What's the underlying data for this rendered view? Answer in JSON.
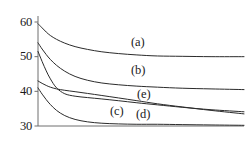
{
  "chart_data": {
    "type": "line",
    "title": "",
    "xlabel": "",
    "ylabel": "",
    "xlim": [
      0,
      100
    ],
    "ylim": [
      30,
      60
    ],
    "grid": false,
    "legend": "inline-curve-labels",
    "y_ticks": [
      {
        "value": 60,
        "label": "60"
      },
      {
        "value": 50,
        "label": "50"
      },
      {
        "value": 40,
        "label": "40"
      },
      {
        "value": 30,
        "label": "30"
      }
    ],
    "x_ticks": [],
    "series": [
      {
        "name": "(a)",
        "label": "(a)",
        "color": "#2b2b2b",
        "x": [
          0,
          2,
          4,
          6,
          9,
          13,
          18,
          24,
          31,
          39,
          48,
          58,
          70,
          84,
          100
        ],
        "values": [
          59.5,
          58.3,
          57.1,
          56.1,
          55.0,
          53.9,
          52.9,
          52.1,
          51.4,
          50.9,
          50.5,
          50.2,
          50.1,
          50.0,
          50.0
        ]
      },
      {
        "name": "(b)",
        "label": "(b)",
        "color": "#2b2b2b",
        "x": [
          0,
          2,
          4,
          6,
          9,
          13,
          18,
          24,
          31,
          39,
          48,
          58,
          70,
          84,
          100
        ],
        "values": [
          54.0,
          52.2,
          50.6,
          49.2,
          47.5,
          45.8,
          44.3,
          43.2,
          42.4,
          41.9,
          41.5,
          41.2,
          40.9,
          40.7,
          40.5
        ]
      },
      {
        "name": "(e)",
        "label": "(e)",
        "color": "#2b2b2b",
        "x": [
          0,
          2,
          4,
          6,
          9,
          13,
          18,
          24,
          31,
          39,
          48,
          58,
          70,
          84,
          100
        ],
        "values": [
          51.5,
          48.6,
          45.9,
          43.6,
          41.0,
          39.3,
          38.6,
          38.2,
          37.8,
          37.3,
          36.7,
          36.1,
          35.4,
          34.7,
          34.1
        ]
      },
      {
        "name": "(c)",
        "label": "(c)",
        "color": "#2b2b2b",
        "x": [
          0,
          2,
          4,
          6,
          9,
          13,
          18,
          24,
          31,
          39,
          48,
          58,
          70,
          84,
          100
        ],
        "values": [
          43.0,
          42.3,
          41.7,
          41.2,
          40.7,
          40.3,
          39.9,
          39.4,
          38.8,
          38.1,
          37.3,
          36.4,
          35.5,
          34.5,
          33.5
        ]
      },
      {
        "name": "(d)",
        "label": "(d)",
        "color": "#2b2b2b",
        "x": [
          0,
          2,
          4,
          6,
          9,
          13,
          18,
          24,
          31,
          39,
          48,
          58,
          70,
          84,
          100
        ],
        "values": [
          41.0,
          39.2,
          37.6,
          36.2,
          34.5,
          33.0,
          31.9,
          31.2,
          30.8,
          30.6,
          30.5,
          30.5,
          30.4,
          30.3,
          30.2
        ]
      }
    ],
    "annotations": [
      {
        "name": "label-a",
        "text": "(a)",
        "left": 131,
        "top": 36
      },
      {
        "name": "label-b",
        "text": "(b)",
        "left": 131,
        "top": 64
      },
      {
        "name": "label-e",
        "text": "(e)",
        "left": 137,
        "top": 88
      },
      {
        "name": "label-c",
        "text": "(c)",
        "left": 110,
        "top": 105
      },
      {
        "name": "label-d",
        "text": "(d)",
        "left": 136,
        "top": 108
      }
    ],
    "axis": {
      "color": "#6e6e6e",
      "y_axis_x": 38,
      "x_axis_y": 126,
      "plot_right": 244,
      "plot_top": 16
    }
  }
}
